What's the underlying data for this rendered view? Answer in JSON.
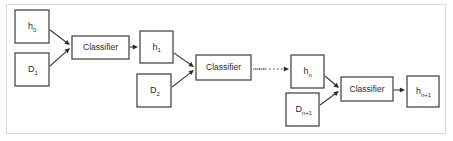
{
  "figure": {
    "background_color": "#ffffff",
    "frame_color": "#d9d9d9",
    "stroke_color": "#3a3a3a",
    "text_color": "#2b2b2b"
  },
  "nodes": [
    {
      "id": "h0",
      "label": "h",
      "sub": "0",
      "kind": "hypothesis",
      "x": 15,
      "y": 10,
      "w": 34,
      "h": 33
    },
    {
      "id": "D1",
      "label": "D",
      "sub": "1",
      "kind": "data",
      "x": 15,
      "y": 53,
      "w": 34,
      "h": 33
    },
    {
      "id": "C1",
      "label": "Classifier",
      "sub": "",
      "kind": "classifier",
      "x": 72,
      "y": 36,
      "w": 57,
      "h": 23
    },
    {
      "id": "h1",
      "label": "h",
      "sub": "1",
      "kind": "hypothesis",
      "x": 140,
      "y": 31,
      "w": 33,
      "h": 32
    },
    {
      "id": "D2",
      "label": "D",
      "sub": "2",
      "kind": "data",
      "x": 137,
      "y": 74,
      "w": 34,
      "h": 33
    },
    {
      "id": "C2",
      "label": "Classifier",
      "sub": "",
      "kind": "classifier",
      "x": 196,
      "y": 55,
      "w": 55,
      "h": 25
    },
    {
      "id": "hn",
      "label": "h",
      "sub": "n",
      "kind": "hypothesis",
      "x": 291,
      "y": 55,
      "w": 33,
      "h": 33
    },
    {
      "id": "Dn1",
      "label": "D",
      "sub": "n+1",
      "kind": "data",
      "x": 286,
      "y": 93,
      "w": 33,
      "h": 33
    },
    {
      "id": "C3",
      "label": "Classifier",
      "sub": "",
      "kind": "classifier",
      "x": 341,
      "y": 77,
      "w": 52,
      "h": 24
    },
    {
      "id": "hn1",
      "label": "h",
      "sub": "n+1",
      "kind": "hypothesis",
      "x": 407,
      "y": 76,
      "w": 32,
      "h": 31
    }
  ],
  "edges": [
    {
      "id": "e1",
      "from": "h0",
      "to": "C1",
      "style": "solid",
      "x1": 50,
      "y1": 30,
      "x2": 70,
      "y2": 45
    },
    {
      "id": "e2",
      "from": "D1",
      "to": "C1",
      "style": "solid",
      "x1": 50,
      "y1": 66,
      "x2": 70,
      "y2": 48
    },
    {
      "id": "e3",
      "from": "C1",
      "to": "h1",
      "style": "solid",
      "x1": 130,
      "y1": 47,
      "x2": 138,
      "y2": 47
    },
    {
      "id": "e4",
      "from": "h1",
      "to": "C2",
      "style": "solid",
      "x1": 174,
      "y1": 53,
      "x2": 194,
      "y2": 67
    },
    {
      "id": "e5",
      "from": "D2",
      "to": "C2",
      "style": "solid",
      "x1": 172,
      "y1": 87,
      "x2": 194,
      "y2": 70
    },
    {
      "id": "e6",
      "from": "C2",
      "to": "hn",
      "style": "dotted",
      "x1": 253,
      "y1": 69,
      "x2": 289,
      "y2": 69
    },
    {
      "id": "e7",
      "from": "hn",
      "to": "C3",
      "style": "solid",
      "x1": 325,
      "y1": 76,
      "x2": 339,
      "y2": 88
    },
    {
      "id": "e8",
      "from": "Dn1",
      "to": "C3",
      "style": "solid",
      "x1": 320,
      "y1": 105,
      "x2": 339,
      "y2": 91
    },
    {
      "id": "e9",
      "from": "C3",
      "to": "hn1",
      "style": "solid",
      "x1": 394,
      "y1": 90,
      "x2": 405,
      "y2": 90
    }
  ],
  "ellipsis": {
    "label": "…",
    "dot_count": 3,
    "x_start": 255,
    "y": 69,
    "spacing": 4
  }
}
